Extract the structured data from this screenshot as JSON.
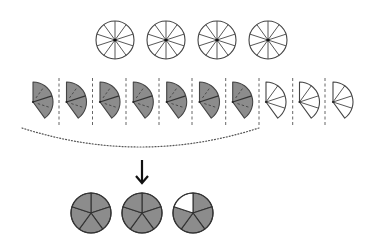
{
  "diagram": {
    "colors": {
      "stroke": "#444444",
      "shaded_fill": "#8c8c8c",
      "unshaded_fill": "#ffffff",
      "dash_stroke": "#666666",
      "arrow": "#111111"
    },
    "top_circles": {
      "count": 4,
      "divisions": 10,
      "centers_x": [
        115,
        166,
        217,
        268
      ],
      "center_y": 40,
      "radius": 19
    },
    "wedges": {
      "count": 10,
      "tenths_per_wedge": 4,
      "shaded_count": 7,
      "unshaded_count": 3,
      "apex_x": [
        33,
        66.5,
        100,
        133.3,
        166.7,
        199.5,
        232.7,
        266,
        299.5,
        333
      ],
      "apex_y": 102,
      "radius": 20,
      "shaded": [
        true,
        true,
        true,
        true,
        true,
        true,
        true,
        false,
        false,
        false
      ]
    },
    "separators": {
      "x": [
        59,
        92.5,
        126,
        159,
        192,
        225.7,
        259,
        292.7,
        325
      ],
      "y_top": 78,
      "y_bottom": 127
    },
    "grouping_arc": {
      "start": [
        22,
        128
      ],
      "control": [
        140,
        166
      ],
      "end": [
        259,
        128
      ]
    },
    "arrow": {
      "x": 142,
      "y_start": 160,
      "y_end": 183
    },
    "result_circles": {
      "divisions": 5,
      "centers_x": [
        91,
        142,
        193
      ],
      "center_y": 213,
      "radius": 20,
      "shaded_sectors": [
        5,
        5,
        4
      ],
      "result_label": "2 4/5"
    }
  }
}
